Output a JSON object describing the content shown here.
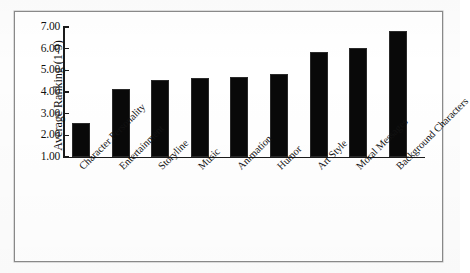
{
  "chart_data": {
    "type": "bar",
    "title": "",
    "xlabel": "",
    "ylabel": "Average Ranking (1-9)",
    "ylim": [
      1.0,
      7.0
    ],
    "ytick_step": 1.0,
    "ytick_labels": [
      "7.00",
      "6.00",
      "5.00",
      "4.00",
      "3.00",
      "2.00",
      "1.00"
    ],
    "ytick_values": [
      7.0,
      6.0,
      5.0,
      4.0,
      3.0,
      2.0,
      1.0
    ],
    "grid": false,
    "legend": false,
    "bar_color": "#090909",
    "categories": [
      "Character Personality",
      "Entertainment",
      "Storyline",
      "Music",
      "Animation",
      "Humor",
      "Art Style",
      "Moral Messages",
      "Background Characters"
    ],
    "values": [
      2.58,
      4.12,
      4.55,
      4.63,
      4.68,
      4.85,
      5.85,
      6.05,
      6.8
    ],
    "category_label_rotation_deg": -45
  },
  "figure": {
    "frame_color": "#8a8a8a",
    "background_color": "#ffffff"
  }
}
